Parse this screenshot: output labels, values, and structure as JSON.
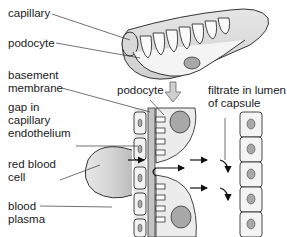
{
  "labels": {
    "capillary": "capillary",
    "podocyte_left": "podocyte",
    "basement_membrane": "basement\nmembrane",
    "gap_endothelium": "gap in\ncapillary\nendothelium",
    "red_blood_cell": "red blood\ncell",
    "blood_plasma": "blood\nplasma",
    "podocyte_center": "podocyte",
    "filtrate": "filtrate in lumen\nof capsule"
  },
  "colors": {
    "line": "#333333",
    "fill_light": "#f2f2f2",
    "fill_mid": "#d6d6d6",
    "fill_dark": "#a8a8a8",
    "arrow_grey": "#bdbdbd"
  }
}
